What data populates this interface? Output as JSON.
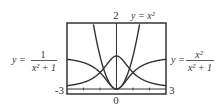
{
  "chart_data": {
    "type": "line",
    "title": "",
    "xlabel": "",
    "ylabel": "",
    "xlim": [
      -3,
      3
    ],
    "ylim": [
      0,
      2
    ],
    "grid": false,
    "tick_labels": {
      "x_left": "-3",
      "x_right": "3",
      "x_center": "0",
      "y_top": "2"
    },
    "series": [
      {
        "name": "y = x^2",
        "formula": "x^2"
      },
      {
        "name": "y = 1/(x^2+1)",
        "formula": "1/(x^2+1)"
      },
      {
        "name": "y = x^2/(x^2+1)",
        "formula": "x^2/(x^2+1)"
      }
    ],
    "annotations": {
      "top_label": "y = x²",
      "left_label_lhs": "y =",
      "left_num": "1",
      "left_den": "x² + 1",
      "right_label_lhs": "y =",
      "right_num": "x²",
      "right_den": "x² + 1"
    }
  }
}
